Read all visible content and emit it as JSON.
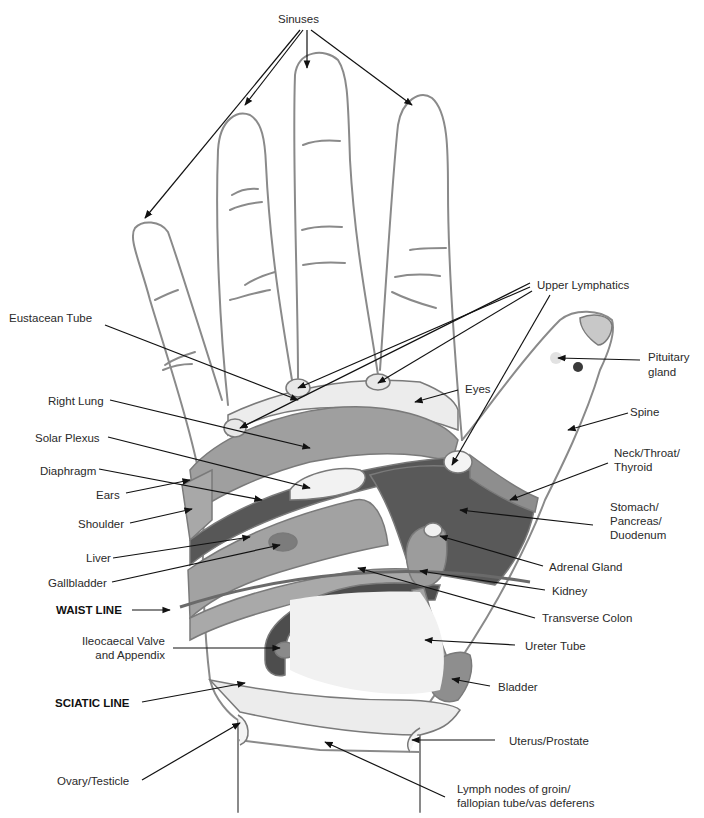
{
  "diagram": {
    "colors": {
      "outline": "#8a8a8a",
      "arrow": "#111111",
      "light_zone": "#e6e6e6",
      "mid_zone": "#9a9a9a",
      "mid_light_zone": "#b4b4b4",
      "dark_zone": "#5a5a5a",
      "darker_zone": "#4a4a4a",
      "white_zone": "#f4f4f4"
    }
  },
  "labels": {
    "sinuses": "Sinuses",
    "upper_lymphatics": "Upper Lymphatics",
    "eustacean_tube": "Eustacean Tube",
    "pituitary_1": "Pituitary",
    "pituitary_2": "gland",
    "eyes": "Eyes",
    "right_lung": "Right Lung",
    "spine": "Spine",
    "solar_plexus": "Solar Plexus",
    "neck_1": "Neck/Throat/",
    "neck_2": "Thyroid",
    "diaphragm": "Diaphragm",
    "ears": "Ears",
    "stomach_1": "Stomach/",
    "stomach_2": "Pancreas/",
    "stomach_3": "Duodenum",
    "shoulder": "Shoulder",
    "liver": "Liver",
    "adrenal": "Adrenal Gland",
    "gallbladder": "Gallbladder",
    "kidney": "Kidney",
    "waist_line": "WAIST LINE",
    "transverse_colon": "Transverse Colon",
    "ileo_1": "Ileocaecal Valve",
    "ileo_2": "and Appendix",
    "ureter": "Ureter Tube",
    "sciatic_line": "SCIATIC LINE",
    "bladder": "Bladder",
    "uterus": "Uterus/Prostate",
    "ovary": "Ovary/Testicle",
    "lymph_1": "Lymph nodes of groin/",
    "lymph_2": "fallopian tube/vas deferens"
  }
}
